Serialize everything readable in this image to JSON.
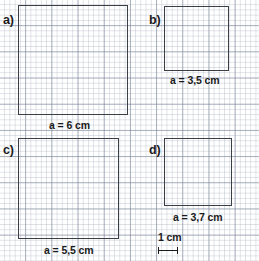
{
  "worksheet": {
    "grid": {
      "unit_label": "cm",
      "minor_cell_mm": 1,
      "major_cell_cm": 1,
      "minor_color": "#aab2c0",
      "major_color": "#7882 96",
      "pixels_per_cm": 18.3
    },
    "outline_color": "#3a3f46",
    "text_color": "#1b1b1b"
  },
  "scale": {
    "label": "1 cm",
    "length_cm": 1
  },
  "panels": [
    {
      "id": "a",
      "letter": "a)",
      "side_label": "a = 6 cm",
      "side_cm": 6,
      "letter_x": 3,
      "letter_y": 14,
      "square_x": 18,
      "square_y": 5,
      "square_size": 110,
      "label_x": 49,
      "label_y": 120
    },
    {
      "id": "b",
      "letter": "b)",
      "side_label": "a = 3,5 cm",
      "side_cm": 3.5,
      "letter_x": 149,
      "letter_y": 14,
      "square_x": 164,
      "square_y": 6,
      "square_size": 65,
      "label_x": 170,
      "label_y": 75
    },
    {
      "id": "c",
      "letter": "c)",
      "side_label": "a = 5,5 cm",
      "side_cm": 5.5,
      "letter_x": 3,
      "letter_y": 144,
      "square_x": 18,
      "square_y": 138,
      "square_size": 101,
      "label_x": 44,
      "label_y": 245
    },
    {
      "id": "d",
      "letter": "d)",
      "side_label": "a = 3,7 cm",
      "side_cm": 3.7,
      "letter_x": 149,
      "letter_y": 144,
      "square_x": 164,
      "square_y": 138,
      "square_size": 68,
      "label_x": 173,
      "label_y": 212
    }
  ]
}
